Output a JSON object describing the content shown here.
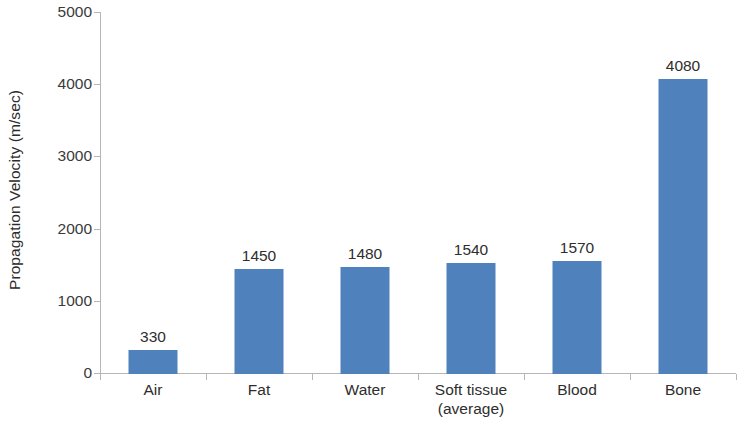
{
  "chart_data": {
    "type": "bar",
    "title": "",
    "subtitle": "",
    "xlabel": "",
    "ylabel": "Propagation Velocity (m/sec)",
    "categories": [
      "Air",
      "Fat",
      "Water",
      "Soft tissue (average)",
      "Blood",
      "Bone"
    ],
    "category_lines": [
      [
        "Air"
      ],
      [
        "Fat"
      ],
      [
        "Water"
      ],
      [
        "Soft tissue",
        "(average)"
      ],
      [
        "Blood"
      ],
      [
        "Bone"
      ]
    ],
    "values": [
      330,
      1450,
      1480,
      1540,
      1570,
      4080
    ],
    "data_labels": [
      "330",
      "1450",
      "1480",
      "1540",
      "1570",
      "4080"
    ],
    "ylim": [
      0,
      5000
    ],
    "ytick_values": [
      0,
      1000,
      2000,
      3000,
      4000,
      5000
    ],
    "ytick_labels": [
      "0",
      "1000",
      "2000",
      "3000",
      "4000",
      "5000"
    ],
    "grid": false,
    "legend": false,
    "legend_position": "none",
    "bar_color": "#4f81bd",
    "axis_color": "#b6b6b6",
    "text_color": "#2e2e2e"
  }
}
